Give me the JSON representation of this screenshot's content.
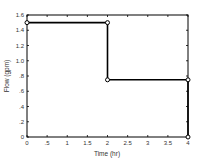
{
  "chart_data": {
    "type": "line",
    "title": "",
    "xlabel": "Time (hr)",
    "ylabel": "Flow (gpm)",
    "xlim": [
      0,
      4
    ],
    "ylim": [
      0,
      1.6
    ],
    "x_ticks": [
      0,
      0.5,
      1,
      1.5,
      2,
      2.5,
      3,
      3.5,
      4
    ],
    "x_tick_labels": [
      "0",
      ".5",
      "1",
      "1.5",
      "2",
      "2.5",
      "3",
      "3.5",
      "4"
    ],
    "y_ticks": [
      0,
      0.2,
      0.4,
      0.6,
      0.8,
      1.0,
      1.2,
      1.4,
      1.6
    ],
    "y_tick_labels": [
      "0",
      ".2",
      ".4",
      ".6",
      ".8",
      "1.0",
      "1.2",
      "1.4",
      "1.6"
    ],
    "grid": false,
    "legend": null,
    "series": [
      {
        "name": "Flow",
        "marker": "open-circle",
        "color": "#000000",
        "x": [
          0,
          2,
          2,
          4,
          4
        ],
        "y": [
          1.5,
          1.5,
          0.75,
          0.75,
          0
        ]
      }
    ]
  }
}
